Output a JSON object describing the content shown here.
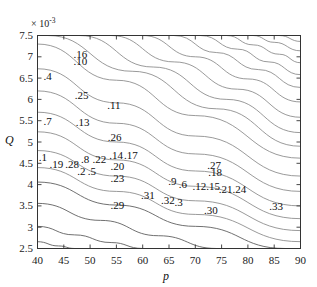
{
  "figure": {
    "type": "contour-plot",
    "background": "#ffffff",
    "width": 317,
    "height": 287
  },
  "axes": {
    "x": {
      "label": "p",
      "min": 40,
      "max": 90,
      "ticks": [
        40,
        45,
        50,
        55,
        60,
        65,
        70,
        75,
        80,
        85,
        90
      ],
      "tick_labels": [
        "40",
        "45",
        "50",
        "55",
        "60",
        "65",
        "70",
        "75",
        "80",
        "85",
        "90"
      ]
    },
    "y": {
      "label": "Q",
      "min": 2.5,
      "max": 7.5,
      "multiplier": "× 10",
      "multiplier_exponent": "-3",
      "ticks": [
        2.5,
        3,
        3.5,
        4,
        4.5,
        5,
        5.5,
        6,
        6.5,
        7,
        7.5
      ],
      "tick_labels": [
        "2.5",
        "3",
        "3.5",
        "4",
        "4.5",
        "5",
        "5.5",
        "6",
        "6.5",
        "7",
        "7.5"
      ]
    }
  },
  "style": {
    "axis_color": "#333333",
    "contour_color": "#808080",
    "contour_color_dark": "#606060",
    "label_color": "#101010"
  },
  "chart_data": {
    "type": "line",
    "title": "",
    "xlabel": "p",
    "ylabel": "Q",
    "xlim": [
      40,
      90
    ],
    "ylim": [
      2.5,
      7.5
    ],
    "y_multiplier": 0.001,
    "grid": false,
    "legend": "none",
    "contour_labels": [
      {
        "text": ".16",
        "p": 48.0,
        "q": 7.05
      },
      {
        "text": ".10",
        "p": 48.0,
        "q": 6.88
      },
      {
        "text": ".4",
        "p": 42.3,
        "q": 6.52
      },
      {
        "text": ".25",
        "p": 48.2,
        "q": 6.08
      },
      {
        "text": ".11",
        "p": 54.4,
        "q": 5.85
      },
      {
        "text": ".7",
        "p": 42.3,
        "q": 5.48
      },
      {
        "text": ".13",
        "p": 48.4,
        "q": 5.45
      },
      {
        "text": ".26",
        "p": 54.5,
        "q": 5.1
      },
      {
        "text": ".1",
        "p": 41.4,
        "q": 4.62
      },
      {
        "text": ".14",
        "p": 54.8,
        "q": 4.68
      },
      {
        "text": ".17",
        "p": 57.6,
        "q": 4.68
      },
      {
        "text": ".19",
        "p": 43.4,
        "q": 4.46
      },
      {
        "text": ".28",
        "p": 46.4,
        "q": 4.46
      },
      {
        "text": ".8",
        "p": 49.4,
        "q": 4.58
      },
      {
        "text": ".22",
        "p": 51.6,
        "q": 4.58
      },
      {
        "text": ".20",
        "p": 55.0,
        "q": 4.41
      },
      {
        "text": ".2",
        "p": 48.7,
        "q": 4.3
      },
      {
        "text": ".5",
        "p": 50.7,
        "q": 4.3
      },
      {
        "text": ".23",
        "p": 55.0,
        "q": 4.14
      },
      {
        "text": ".27",
        "p": 73.4,
        "q": 4.44
      },
      {
        "text": ".18",
        "p": 73.6,
        "q": 4.27
      },
      {
        "text": ".9",
        "p": 66.0,
        "q": 4.06
      },
      {
        "text": ".6",
        "p": 68.0,
        "q": 3.98
      },
      {
        "text": ".12",
        "p": 70.6,
        "q": 3.94
      },
      {
        "text": ".15",
        "p": 73.2,
        "q": 3.94
      },
      {
        "text": ".21",
        "p": 75.6,
        "q": 3.88
      },
      {
        "text": ".24",
        "p": 78.2,
        "q": 3.88
      },
      {
        "text": ".31",
        "p": 60.8,
        "q": 3.74
      },
      {
        "text": ".32",
        "p": 64.6,
        "q": 3.62
      },
      {
        "text": ".3",
        "p": 67.2,
        "q": 3.56
      },
      {
        "text": ".29",
        "p": 55.0,
        "q": 3.5
      },
      {
        "text": ".30",
        "p": 72.8,
        "q": 3.38
      },
      {
        "text": ".33",
        "p": 85.2,
        "q": 3.48
      }
    ],
    "contour_lines": [
      {
        "id": "c1",
        "points": [
          [
            40,
            7.3
          ],
          [
            55,
            6.45
          ],
          [
            70,
            5.62
          ],
          [
            90,
            4.62
          ]
        ]
      },
      {
        "id": "c2",
        "points": [
          [
            40,
            6.72
          ],
          [
            55,
            5.92
          ],
          [
            70,
            5.14
          ],
          [
            90,
            4.2
          ]
        ]
      },
      {
        "id": "c3",
        "points": [
          [
            40,
            6.2
          ],
          [
            55,
            5.44
          ],
          [
            70,
            4.72
          ],
          [
            90,
            3.84
          ]
        ]
      },
      {
        "id": "c4",
        "points": [
          [
            40,
            5.7
          ],
          [
            55,
            5.0
          ],
          [
            70,
            4.32
          ],
          [
            90,
            3.5
          ]
        ]
      },
      {
        "id": "c5",
        "points": [
          [
            40,
            5.24
          ],
          [
            55,
            4.58
          ],
          [
            70,
            3.96
          ],
          [
            90,
            3.2
          ]
        ]
      },
      {
        "id": "c6",
        "points": [
          [
            40,
            4.8
          ],
          [
            55,
            4.2
          ],
          [
            70,
            3.62
          ],
          [
            90,
            2.92
          ]
        ]
      },
      {
        "id": "c7",
        "points": [
          [
            40,
            4.4
          ],
          [
            55,
            3.84
          ],
          [
            70,
            3.3
          ],
          [
            90,
            2.66
          ]
        ]
      },
      {
        "id": "c8",
        "points": [
          [
            40,
            4.06
          ],
          [
            55,
            3.52
          ],
          [
            70,
            3.02
          ],
          [
            87,
            2.5
          ]
        ]
      },
      {
        "id": "c9",
        "points": [
          [
            40,
            3.56
          ],
          [
            52,
            3.16
          ],
          [
            63,
            2.8
          ],
          [
            74,
            2.5
          ]
        ]
      },
      {
        "id": "c10",
        "points": [
          [
            40,
            3.02
          ],
          [
            47,
            2.82
          ],
          [
            54,
            2.64
          ],
          [
            60,
            2.5
          ]
        ]
      },
      {
        "id": "c11",
        "points": [
          [
            40,
            2.66
          ],
          [
            44,
            2.56
          ],
          [
            47,
            2.5
          ]
        ]
      },
      {
        "id": "c12",
        "points": [
          [
            42,
            7.5
          ],
          [
            58,
            6.66
          ],
          [
            74,
            5.78
          ],
          [
            90,
            4.9
          ]
        ]
      },
      {
        "id": "c13",
        "points": [
          [
            48,
            7.5
          ],
          [
            62,
            6.76
          ],
          [
            76,
            6.0
          ],
          [
            90,
            5.22
          ]
        ]
      },
      {
        "id": "c14",
        "points": [
          [
            54,
            7.5
          ],
          [
            66,
            6.88
          ],
          [
            78,
            6.24
          ],
          [
            90,
            5.58
          ]
        ]
      },
      {
        "id": "c15",
        "points": [
          [
            60,
            7.5
          ],
          [
            70,
            7.0
          ],
          [
            80,
            6.48
          ],
          [
            90,
            5.94
          ]
        ]
      },
      {
        "id": "c16",
        "points": [
          [
            66,
            7.5
          ],
          [
            74,
            7.1
          ],
          [
            82,
            6.7
          ],
          [
            90,
            6.28
          ]
        ]
      },
      {
        "id": "c17",
        "points": [
          [
            71,
            7.5
          ],
          [
            78,
            7.18
          ],
          [
            84,
            6.88
          ],
          [
            90,
            6.58
          ]
        ]
      },
      {
        "id": "c18",
        "points": [
          [
            76,
            7.5
          ],
          [
            81,
            7.28
          ],
          [
            86,
            7.06
          ],
          [
            90,
            6.86
          ]
        ]
      },
      {
        "id": "c19",
        "points": [
          [
            81,
            7.5
          ],
          [
            85,
            7.34
          ],
          [
            90,
            7.14
          ]
        ]
      },
      {
        "id": "c20",
        "points": [
          [
            86,
            7.5
          ],
          [
            90,
            7.36
          ]
        ]
      }
    ]
  }
}
